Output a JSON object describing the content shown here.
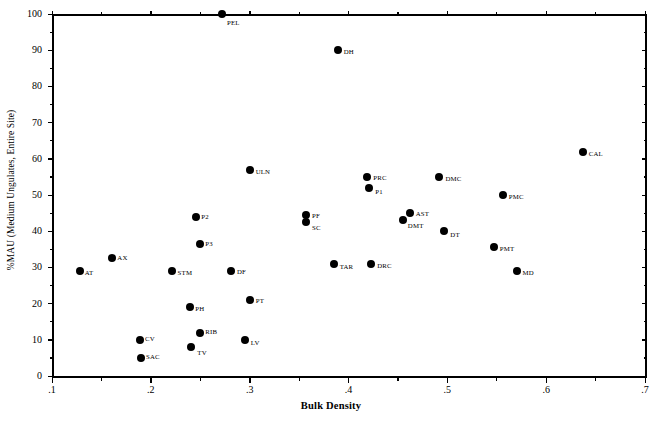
{
  "chart_data": {
    "type": "scatter",
    "title": "",
    "xlabel": "Bulk Density",
    "ylabel": "%MAU (Medium Ungulates, Entire Site)",
    "xlim": [
      0.1,
      0.7
    ],
    "ylim": [
      0,
      100
    ],
    "xticks": [
      ".1",
      ".2",
      ".3",
      ".4",
      ".5",
      ".6",
      ".7"
    ],
    "xtick_values": [
      0.1,
      0.2,
      0.3,
      0.4,
      0.5,
      0.6,
      0.7
    ],
    "yticks": [
      "0",
      "10",
      "20",
      "30",
      "40",
      "50",
      "60",
      "70",
      "80",
      "90",
      "100"
    ],
    "ytick_values": [
      0,
      10,
      20,
      30,
      40,
      50,
      60,
      70,
      80,
      90,
      100
    ],
    "grid": false,
    "legend": null,
    "minor_ticks": true,
    "marker_color": "#000000",
    "axis_color": "#000000",
    "points": [
      {
        "label": "PEL",
        "x": 0.272,
        "y": 100,
        "lx": 5,
        "ly": 5
      },
      {
        "label": "DH",
        "x": 0.389,
        "y": 90,
        "lx": 6,
        "ly": -2
      },
      {
        "label": "CAL",
        "x": 0.637,
        "y": 62,
        "lx": 6,
        "ly": -2
      },
      {
        "label": "ULN",
        "x": 0.3,
        "y": 57,
        "lx": 6,
        "ly": -2
      },
      {
        "label": "PRC",
        "x": 0.419,
        "y": 55,
        "lx": 6,
        "ly": -3
      },
      {
        "label": "DMC",
        "x": 0.492,
        "y": 55,
        "lx": 6,
        "ly": -2
      },
      {
        "label": "P1",
        "x": 0.421,
        "y": 52,
        "lx": 6,
        "ly": 0
      },
      {
        "label": "PMC",
        "x": 0.556,
        "y": 50,
        "lx": 6,
        "ly": -2
      },
      {
        "label": "AST",
        "x": 0.462,
        "y": 45,
        "lx": 6,
        "ly": -3
      },
      {
        "label": "PF",
        "x": 0.357,
        "y": 44.5,
        "lx": 6,
        "ly": -3
      },
      {
        "label": "P2",
        "x": 0.246,
        "y": 44,
        "lx": 5,
        "ly": -4
      },
      {
        "label": "SC",
        "x": 0.357,
        "y": 42.5,
        "lx": 6,
        "ly": 2
      },
      {
        "label": "DMT",
        "x": 0.455,
        "y": 43,
        "lx": 5,
        "ly": 2
      },
      {
        "label": "DT",
        "x": 0.497,
        "y": 40,
        "lx": 6,
        "ly": 0
      },
      {
        "label": "P3",
        "x": 0.25,
        "y": 36.5,
        "lx": 5,
        "ly": -4
      },
      {
        "label": "PMT",
        "x": 0.547,
        "y": 35.5,
        "lx": 6,
        "ly": -2
      },
      {
        "label": "AX",
        "x": 0.161,
        "y": 32.5,
        "lx": 5,
        "ly": -4
      },
      {
        "label": "TAR",
        "x": 0.385,
        "y": 31,
        "lx": 6,
        "ly": -1
      },
      {
        "label": "DRC",
        "x": 0.423,
        "y": 31,
        "lx": 6,
        "ly": -2
      },
      {
        "label": "AT",
        "x": 0.128,
        "y": 29,
        "lx": 5,
        "ly": -2
      },
      {
        "label": "STM",
        "x": 0.221,
        "y": 29,
        "lx": 6,
        "ly": -2
      },
      {
        "label": "DF",
        "x": 0.281,
        "y": 29,
        "lx": 6,
        "ly": -3
      },
      {
        "label": "MD",
        "x": 0.57,
        "y": 29,
        "lx": 6,
        "ly": -2
      },
      {
        "label": "PT",
        "x": 0.3,
        "y": 21,
        "lx": 6,
        "ly": -3
      },
      {
        "label": "PH",
        "x": 0.24,
        "y": 19,
        "lx": 5,
        "ly": -2
      },
      {
        "label": "RIB",
        "x": 0.25,
        "y": 12,
        "lx": 5,
        "ly": -5
      },
      {
        "label": "CV",
        "x": 0.189,
        "y": 10,
        "lx": 5,
        "ly": -5
      },
      {
        "label": "LV",
        "x": 0.295,
        "y": 10,
        "lx": 6,
        "ly": -1
      },
      {
        "label": "TV",
        "x": 0.241,
        "y": 8,
        "lx": 6,
        "ly": 2
      },
      {
        "label": "SAC",
        "x": 0.19,
        "y": 5,
        "lx": 5,
        "ly": -5
      }
    ]
  }
}
